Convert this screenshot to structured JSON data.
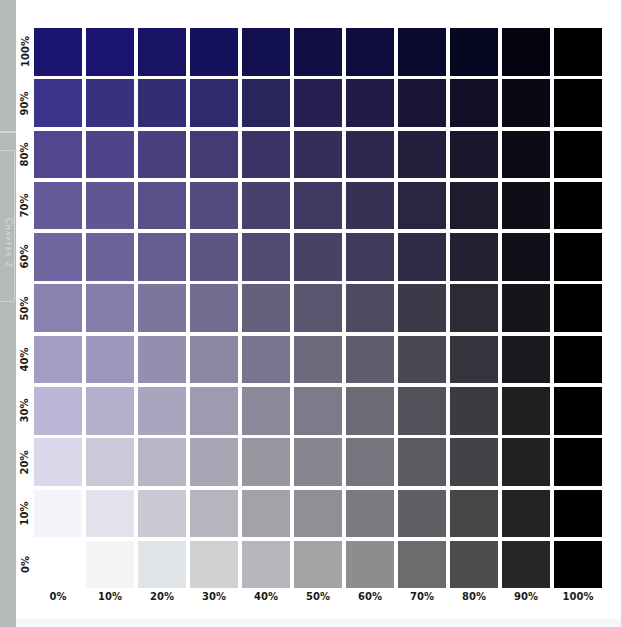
{
  "side_tab": {
    "label": "Chapter 2"
  },
  "chart_data": {
    "type": "heatmap",
    "title": "",
    "xlabel": "Black percentage",
    "ylabel": "Violet tint percentage",
    "x_categories": [
      "0%",
      "10%",
      "20%",
      "30%",
      "40%",
      "50%",
      "60%",
      "70%",
      "80%",
      "90%",
      "100%"
    ],
    "y_categories": [
      "100%",
      "90%",
      "80%",
      "70%",
      "60%",
      "50%",
      "40%",
      "30%",
      "20%",
      "10%",
      "0%"
    ],
    "grid": false,
    "base_color": "#1a1670",
    "colors": [
      [
        "#1a1670",
        "#191571",
        "#171466",
        "#15125d",
        "#12104f",
        "#110e46",
        "#0e0c3d",
        "#0b092f",
        "#080721",
        "#040411",
        "#000000"
      ],
      [
        "#3c338a",
        "#39307f",
        "#342d74",
        "#30296b",
        "#2a245d",
        "#262052",
        "#211c47",
        "#1a1636",
        "#120f27",
        "#090814",
        "#000000"
      ],
      [
        "#52478f",
        "#4f4489",
        "#4a3f7e",
        "#443a74",
        "#3b3365",
        "#352d5a",
        "#2e274e",
        "#231e3c",
        "#19152b",
        "#0c0b15",
        "#000000"
      ],
      [
        "#65599a",
        "#615594",
        "#5a4f88",
        "#534a7e",
        "#49406d",
        "#413962",
        "#383155",
        "#2b2541",
        "#1f1b2f",
        "#0f0e17",
        "#000000"
      ],
      [
        "#7066a0",
        "#6c629a",
        "#655c8f",
        "#5d5584",
        "#524a73",
        "#494267",
        "#3f395a",
        "#302c45",
        "#232032",
        "#111018",
        "#000000"
      ],
      [
        "#8a81b0",
        "#857ca9",
        "#7c759c",
        "#736c90",
        "#64607c",
        "#5b566f",
        "#4f4a60",
        "#3c3949",
        "#2c2a35",
        "#16151b",
        "#000000"
      ],
      [
        "#a49cc4",
        "#9e97bd",
        "#958faf",
        "#8b86a2",
        "#7a758e",
        "#6d6a7e",
        "#5f5c6c",
        "#4a4853",
        "#36343c",
        "#1b1a1e",
        "#000000"
      ],
      [
        "#bdb5d5",
        "#b5aecc",
        "#aaa4be",
        "#9f9ab0",
        "#8c8899",
        "#7e7a89",
        "#6d6a76",
        "#55525b",
        "#3d3b41",
        "#1f1e21",
        "#000000"
      ],
      [
        "#dcd8ec",
        "#cbc8d9",
        "#b9b7c6",
        "#a9a7b5",
        "#98969f",
        "#87858f",
        "#76747c",
        "#5c5b61",
        "#434246",
        "#222123",
        "#000000"
      ],
      [
        "#f5f4fb",
        "#e2e1ec",
        "#c9c9d3",
        "#b5b5bd",
        "#a2a2a9",
        "#8f8f95",
        "#7a7a80",
        "#606064",
        "#464649",
        "#232325",
        "#000000"
      ],
      [
        "#ffffff",
        "#f4f5f6",
        "#e1e4e6",
        "#cfd1d3",
        "#b5b7ba",
        "#a2a4a6",
        "#8c8d8f",
        "#6b6c6e",
        "#4c4c4e",
        "#262628",
        "#000000"
      ]
    ]
  }
}
